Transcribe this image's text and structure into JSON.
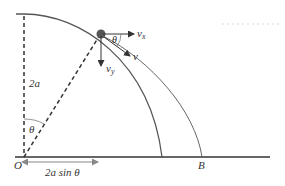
{
  "diagram": {
    "type": "physics-projectile-from-sphere",
    "labels": {
      "height": "2a",
      "angle_at_O": "θ",
      "angle_at_particle": "θ",
      "origin": "O",
      "landing_point": "B",
      "horizontal_distance": "2a sin θ",
      "vx": "v",
      "vx_sub": "x",
      "vy": "v",
      "vy_sub": "y",
      "v": "v"
    },
    "colors": {
      "line": "#333333",
      "curve": "#555555",
      "particle": "#555555",
      "arrow_grey": "#888888"
    }
  }
}
